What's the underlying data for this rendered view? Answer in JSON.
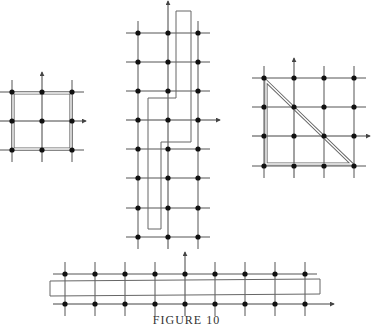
{
  "caption": "FIGURE 10",
  "colors": {
    "line": "#555555",
    "dot": "#111111",
    "path": "#666666",
    "background": "#ffffff"
  },
  "figures": [
    {
      "id": "square",
      "grid_x": [
        12,
        42,
        72
      ],
      "grid_y": [
        92,
        121,
        150
      ],
      "axis": {
        "origin_x": 42,
        "origin_y": 121,
        "y_top": 72,
        "x_right": 86
      },
      "shape": "double-square",
      "path": [
        [
          13,
          93
        ],
        [
          71,
          93
        ],
        [
          71,
          149
        ],
        [
          13,
          149
        ]
      ]
    },
    {
      "id": "tall-strip",
      "grid_x": [
        138,
        168,
        198
      ],
      "grid_y": [
        33,
        62,
        91,
        120,
        149,
        178,
        208,
        237
      ],
      "axis": {
        "origin_x": 168,
        "origin_y": 120,
        "y_top": 1,
        "x_right": 220
      },
      "shape": "stepped-polygon",
      "path": [
        [
          176,
          11
        ],
        [
          191,
          11
        ],
        [
          191,
          142
        ],
        [
          161,
          142
        ],
        [
          161,
          229
        ],
        [
          148,
          229
        ],
        [
          148,
          98
        ],
        [
          176,
          98
        ]
      ]
    },
    {
      "id": "triangle",
      "grid_x": [
        264,
        294,
        324,
        354
      ],
      "grid_y": [
        78,
        107,
        136,
        166
      ],
      "axis": {
        "origin_x": 294,
        "origin_y": 136,
        "y_top": 58,
        "x_right": 370
      },
      "shape": "double-triangle",
      "path": [
        [
          266,
          81
        ],
        [
          266,
          164
        ],
        [
          352,
          164
        ]
      ]
    },
    {
      "id": "horizontal-strip",
      "grid_x": [
        65,
        95,
        125,
        155,
        185,
        215,
        245,
        275,
        305
      ],
      "grid_y": [
        274,
        304
      ],
      "axis": {
        "origin_x": 185,
        "origin_y": 304,
        "y_top": 252,
        "x_right": 334
      },
      "shape": "rectangle",
      "path": [
        [
          50,
          281
        ],
        [
          320,
          279
        ],
        [
          320,
          294
        ],
        [
          50,
          296
        ]
      ]
    }
  ]
}
